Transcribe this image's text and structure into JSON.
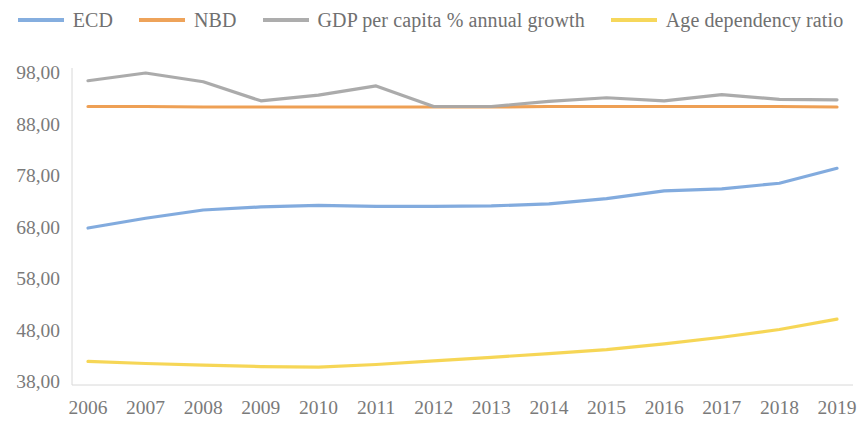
{
  "legend": {
    "position": "top",
    "items": [
      {
        "label": "ECD",
        "color": "#7BA7DC",
        "key": "ecd"
      },
      {
        "label": "NBD",
        "color": "#ED9B4C",
        "key": "nbd"
      },
      {
        "label": "GDP per capita % annual growth",
        "color": "#A6A6A6",
        "key": "gdp"
      },
      {
        "label": "Age dependency ratio",
        "color": "#F5D githubD",
        "key": "age"
      }
    ]
  },
  "chart_data": {
    "type": "line",
    "title": "",
    "subtitle": "",
    "xlabel": "",
    "ylabel": "",
    "grid": false,
    "legend_position": "top",
    "decimal_separator": ",",
    "categories": [
      "2006",
      "2007",
      "2008",
      "2009",
      "2010",
      "2011",
      "2012",
      "2013",
      "2014",
      "2015",
      "2016",
      "2017",
      "2018",
      "2019"
    ],
    "x": [
      2006,
      2007,
      2008,
      2009,
      2010,
      2011,
      2012,
      2013,
      2014,
      2015,
      2016,
      2017,
      2018,
      2019
    ],
    "ylim": [
      38.0,
      98.0
    ],
    "yticks": [
      38.0,
      48.0,
      58.0,
      68.0,
      78.0,
      88.0,
      98.0
    ],
    "ytick_labels": [
      "38,00",
      "48,00",
      "58,00",
      "68,00",
      "78,00",
      "88,00",
      "98,00"
    ],
    "xtick_labels": [
      "2006",
      "2007",
      "2008",
      "2009",
      "2010",
      "2011",
      "2012",
      "2013",
      "2014",
      "2015",
      "2016",
      "2017",
      "2018",
      "2019"
    ],
    "series": [
      {
        "name": "ECD",
        "color": "#7BA7DC",
        "values": [
          67.7,
          69.6,
          71.2,
          71.8,
          72.1,
          71.9,
          71.9,
          72.0,
          72.4,
          73.4,
          74.9,
          75.3,
          76.4,
          79.3
        ]
      },
      {
        "name": "NBD",
        "color": "#ED9B4C",
        "values": [
          91.3,
          91.3,
          91.2,
          91.2,
          91.2,
          91.2,
          91.2,
          91.2,
          91.3,
          91.3,
          91.3,
          91.3,
          91.3,
          91.2
        ]
      },
      {
        "name": "GDP per capita % annual growth",
        "color": "#A6A6A6",
        "values": [
          96.3,
          97.8,
          96.1,
          92.4,
          93.5,
          95.3,
          91.3,
          91.3,
          92.3,
          93.0,
          92.4,
          93.6,
          92.7,
          92.6
        ]
      },
      {
        "name": "Age dependency ratio",
        "color": "#F5D44D",
        "values": [
          41.8,
          41.4,
          41.1,
          40.8,
          40.7,
          41.2,
          41.9,
          42.6,
          43.3,
          44.1,
          45.2,
          46.5,
          48.0,
          50.0
        ]
      }
    ]
  }
}
